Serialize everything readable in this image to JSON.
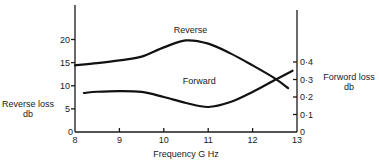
{
  "chart_data": {
    "type": "line",
    "title": "",
    "xlabel": "Frequency  G Hz",
    "ylabel": "Reverse loss db",
    "y2label": "Forword loss db",
    "xlim": [
      8,
      13
    ],
    "ylim": [
      0,
      25
    ],
    "y2lim": [
      0,
      0.5
    ],
    "x_ticks": [
      "8",
      "9",
      "10",
      "11",
      "12",
      "13"
    ],
    "y_ticks": [
      "0",
      "5",
      "10",
      "15",
      "20"
    ],
    "y2_ticks": [
      "0",
      "0·1",
      "0·2",
      "0·3",
      "0·4"
    ],
    "grid": false,
    "series": [
      {
        "name": "Reverse",
        "axis": "left",
        "x": [
          8.0,
          8.5,
          9.0,
          9.5,
          10.0,
          10.5,
          11.0,
          11.5,
          12.0,
          12.5,
          12.8
        ],
        "y": [
          14.4,
          14.9,
          15.5,
          16.3,
          18.3,
          19.8,
          19.1,
          17.0,
          14.4,
          11.6,
          9.5
        ]
      },
      {
        "name": "Forward",
        "axis": "right",
        "x": [
          8.2,
          8.5,
          9.0,
          9.5,
          10.0,
          10.5,
          11.0,
          11.5,
          12.0,
          12.5,
          12.9
        ],
        "y": [
          0.223,
          0.23,
          0.234,
          0.229,
          0.2,
          0.166,
          0.143,
          0.171,
          0.229,
          0.297,
          0.35
        ]
      }
    ],
    "annotations": [
      {
        "text": "Reverse",
        "x": 10.6,
        "y": 21.3,
        "axis": "left"
      },
      {
        "text": "Forward",
        "x": 10.8,
        "y": 0.275,
        "axis": "right"
      }
    ]
  }
}
